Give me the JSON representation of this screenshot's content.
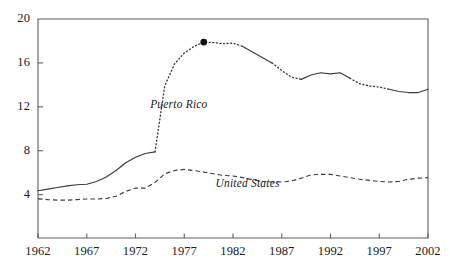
{
  "chart_data": {
    "type": "line",
    "title": "",
    "subtitle": "",
    "xlabel": "",
    "ylabel": "",
    "xlim": [
      1962,
      2002
    ],
    "ylim": [
      0.05,
      20
    ],
    "grid": false,
    "legend_position": "inline-annotations",
    "x_ticks": [
      "1962",
      "1967",
      "1972",
      "1977",
      "1982",
      "1987",
      "1992",
      "1997",
      "2002"
    ],
    "x_tick_values": [
      1962,
      1967,
      1972,
      1977,
      1982,
      1987,
      1992,
      1997,
      2002
    ],
    "y_ticks": [
      "4",
      "8",
      "12",
      "16",
      "20"
    ],
    "y_tick_values": [
      4,
      8,
      12,
      16,
      20
    ],
    "x": [
      1962,
      1963,
      1964,
      1965,
      1966,
      1967,
      1968,
      1969,
      1970,
      1971,
      1972,
      1973,
      1974,
      1975,
      1976,
      1977,
      1978,
      1979,
      1980,
      1981,
      1982,
      1983,
      1984,
      1985,
      1986,
      1987,
      1988,
      1989,
      1990,
      1991,
      1992,
      1993,
      1994,
      1995,
      1996,
      1997,
      1998,
      1999,
      2000,
      2001,
      2002
    ],
    "series": [
      {
        "name": "Puerto Rico",
        "style": "solid-and-dotted",
        "color": "#3a3a38",
        "values": [
          4.35,
          4.5,
          4.65,
          4.8,
          4.9,
          4.95,
          5.2,
          5.6,
          6.2,
          6.9,
          7.4,
          7.75,
          7.9,
          13.9,
          15.9,
          16.9,
          17.5,
          17.9,
          17.85,
          17.75,
          17.8,
          17.5,
          17.0,
          16.5,
          16.0,
          15.3,
          14.7,
          14.5,
          14.9,
          15.1,
          15.0,
          15.1,
          14.6,
          14.1,
          13.9,
          13.8,
          13.6,
          13.4,
          13.3,
          13.3,
          13.6
        ]
      },
      {
        "name": "United States",
        "style": "dashed",
        "color": "#3a3a38",
        "values": [
          3.62,
          3.55,
          3.5,
          3.5,
          3.55,
          3.6,
          3.6,
          3.65,
          3.85,
          4.3,
          4.6,
          4.6,
          5.1,
          5.9,
          6.2,
          6.3,
          6.2,
          6.05,
          5.9,
          5.75,
          5.7,
          5.55,
          5.35,
          5.2,
          5.15,
          5.15,
          5.25,
          5.5,
          5.8,
          5.85,
          5.85,
          5.7,
          5.55,
          5.4,
          5.3,
          5.2,
          5.15,
          5.2,
          5.4,
          5.5,
          5.55
        ]
      }
    ],
    "annotations": [
      {
        "name": "Puerto Rico",
        "label": "Puerto Rico",
        "x": 1973.5,
        "y": 12.1
      },
      {
        "name": "United States",
        "label": "United States",
        "x": 1980.2,
        "y": 4.9
      }
    ],
    "markers": [
      {
        "series": "Puerto Rico",
        "x": 1979,
        "y": 17.9,
        "shape": "filled-circle"
      }
    ]
  }
}
